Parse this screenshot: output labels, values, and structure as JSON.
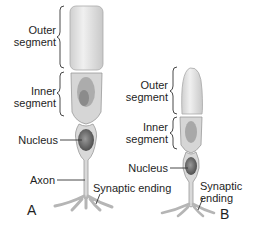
{
  "figure": {
    "panel_a": {
      "letter": "A",
      "labels": {
        "outer_1": "Outer",
        "outer_2": "segment",
        "inner_1": "Inner",
        "inner_2": "segment",
        "nucleus": "Nucleus",
        "axon": "Axon",
        "synaptic": "Synaptic ending"
      }
    },
    "panel_b": {
      "letter": "B",
      "labels": {
        "outer_1": "Outer",
        "outer_2": "segment",
        "inner_1": "Inner",
        "inner_2": "segment",
        "nucleus": "Nucleus",
        "synaptic_1": "Synaptic",
        "synaptic_2": "ending"
      }
    },
    "colors": {
      "outer_fill": "#e6e6e6",
      "cell_fill": "#d9d9d9",
      "outline": "#9a9a9a",
      "nucleus_fill": "#6e6e6e",
      "line": "#333333"
    }
  }
}
